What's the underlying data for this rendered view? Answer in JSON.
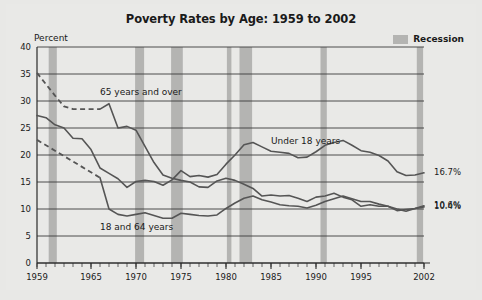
{
  "figure": {
    "title": "Poverty Rates by Age: 1959 to 2002",
    "y_axis_label": "Percent",
    "legend": {
      "recession_label": "Recession",
      "recession_color": "#b4b4b2"
    },
    "background_color": "#e9e9e7",
    "line_color": "#555555",
    "grid_color": "#3a3a3a"
  },
  "chart_data": {
    "type": "line",
    "title": "Poverty Rates by Age: 1959 to 2002",
    "xlabel": "",
    "ylabel": "Percent",
    "xlim": [
      1959,
      2002
    ],
    "ylim": [
      0,
      40
    ],
    "ytick_labels": [
      "0",
      "5",
      "10",
      "15",
      "20",
      "25",
      "30",
      "35",
      "40"
    ],
    "ytick_values": [
      0,
      5,
      10,
      15,
      20,
      25,
      30,
      35,
      40
    ],
    "xtick_labels": [
      "1959",
      "1965",
      "1970",
      "1975",
      "1980",
      "1985",
      "1990",
      "1995",
      "2002"
    ],
    "xtick_values": [
      1959,
      1965,
      1970,
      1975,
      1980,
      1985,
      1990,
      1995,
      2002
    ],
    "grid": true,
    "legend_position": "top-right",
    "annotations": [
      {
        "text": "65 years and over",
        "x": 1966,
        "y": 31.5
      },
      {
        "text": "Under 18 years",
        "x": 1985,
        "y": 22.5
      },
      {
        "text": "18 and 64 years",
        "x": 1966,
        "y": 6.5
      }
    ],
    "end_labels": [
      {
        "text": "16.7%",
        "series": "Under 18 years",
        "value": 16.7
      },
      {
        "text": "10.6%",
        "series": "18 to 64 years",
        "value": 10.6
      },
      {
        "text": "10.4%",
        "series": "65 years and over",
        "value": 10.4
      }
    ],
    "x": [
      1959,
      1960,
      1961,
      1962,
      1963,
      1964,
      1965,
      1966,
      1967,
      1968,
      1969,
      1970,
      1971,
      1972,
      1973,
      1974,
      1975,
      1976,
      1977,
      1978,
      1979,
      1980,
      1981,
      1982,
      1983,
      1984,
      1985,
      1986,
      1987,
      1988,
      1989,
      1990,
      1991,
      1992,
      1993,
      1994,
      1995,
      1996,
      1997,
      1998,
      1999,
      2000,
      2001,
      2002
    ],
    "series": [
      {
        "name": "65 years and over",
        "dashed_until": 1966,
        "values": [
          35.2,
          33.1,
          31.0,
          29.0,
          28.5,
          28.5,
          28.5,
          28.5,
          29.5,
          25.0,
          25.3,
          24.6,
          21.6,
          18.6,
          16.3,
          15.7,
          15.3,
          15.0,
          14.1,
          14.0,
          15.2,
          15.7,
          15.3,
          14.6,
          13.8,
          12.4,
          12.6,
          12.4,
          12.5,
          12.0,
          11.4,
          12.2,
          12.4,
          12.9,
          12.2,
          11.7,
          10.5,
          10.8,
          10.5,
          10.5,
          9.7,
          9.9,
          10.1,
          10.4
        ]
      },
      {
        "name": "Under 18 years",
        "dashed_until": 1959,
        "values": [
          27.3,
          26.9,
          25.6,
          25.0,
          23.1,
          23.0,
          21.0,
          17.6,
          16.6,
          15.6,
          14.0,
          15.1,
          15.3,
          15.1,
          14.4,
          15.4,
          17.1,
          16.0,
          16.2,
          15.9,
          16.4,
          18.3,
          20.0,
          21.9,
          22.3,
          21.5,
          20.7,
          20.5,
          20.3,
          19.5,
          19.6,
          20.6,
          21.8,
          22.3,
          22.7,
          21.8,
          20.8,
          20.5,
          19.9,
          18.9,
          16.9,
          16.2,
          16.3,
          16.7
        ]
      },
      {
        "name": "18 to 64 years",
        "dashed_until": 1966,
        "values": [
          22.8,
          21.8,
          20.8,
          19.8,
          18.8,
          17.8,
          16.8,
          15.8,
          10.0,
          9.0,
          8.7,
          9.0,
          9.3,
          8.8,
          8.3,
          8.3,
          9.2,
          9.0,
          8.8,
          8.7,
          8.9,
          10.1,
          11.1,
          12.0,
          12.4,
          11.7,
          11.3,
          10.8,
          10.6,
          10.5,
          10.2,
          10.7,
          11.4,
          11.9,
          12.4,
          11.9,
          11.4,
          11.4,
          10.9,
          10.5,
          10.0,
          9.6,
          10.1,
          10.6
        ]
      }
    ],
    "recessions": [
      {
        "start": 1960.3,
        "end": 1961.2
      },
      {
        "start": 1969.9,
        "end": 1970.9
      },
      {
        "start": 1973.9,
        "end": 1975.2
      },
      {
        "start": 1980.1,
        "end": 1980.6
      },
      {
        "start": 1981.5,
        "end": 1982.9
      },
      {
        "start": 1990.5,
        "end": 1991.2
      },
      {
        "start": 2001.2,
        "end": 2001.9
      }
    ]
  }
}
